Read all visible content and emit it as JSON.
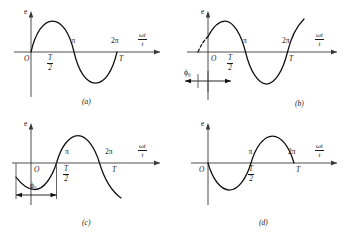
{
  "figure": {
    "type": "diagram",
    "background_color": "#ffffff",
    "curve_color": "#111111",
    "axis_color": "#3a3a3a",
    "panel_count": 4
  },
  "axis_labels": {
    "vertical": "e",
    "horizontal_numerator": "ωt",
    "horizontal_denominator": "t",
    "origin": "O",
    "pi": "π",
    "two_pi": "2π",
    "half_period_numerator": "T",
    "half_period_denominator": "2",
    "period": "T",
    "phase": "ϕ",
    "phase_subscript": "0"
  },
  "panels": [
    {
      "id": "a",
      "caption": "(a)",
      "phase_label": null,
      "description": "Sine wave starting at zero with zero initial phase",
      "waveform": {
        "form": "sine",
        "amplitude": 1,
        "phase_deg": 0,
        "start_value": 0,
        "first_half_sign": "positive",
        "dashed_lead_in": false,
        "dimension_arrow": false
      },
      "tick_labels_above": [
        "π",
        "2π"
      ],
      "tick_labels_below": [
        "O",
        "T/2",
        "T"
      ]
    },
    {
      "id": "b",
      "caption": "(b)",
      "phase_label": "ϕ₀",
      "description": "Sine wave leading by initial phase angle phi-zero, positive at t = 0",
      "waveform": {
        "form": "sine",
        "amplitude": 1,
        "phase_deg": 30,
        "start_value": 0.5,
        "first_half_sign": "positive",
        "dashed_lead_in": true,
        "dimension_arrow": true,
        "dimension_direction": "leading"
      },
      "tick_labels_above": [
        "π",
        "2π"
      ],
      "tick_labels_below": [
        "O",
        "T/2",
        "T"
      ]
    },
    {
      "id": "c",
      "caption": "(c)",
      "phase_label": "ϕ₀",
      "description": "Sine wave lagging by initial phase angle phi-zero, negative at t = 0",
      "waveform": {
        "form": "sine",
        "amplitude": 1,
        "phase_deg": -60,
        "start_value": -0.87,
        "first_half_sign": "negative",
        "dashed_lead_in": false,
        "dimension_arrow": true,
        "dimension_direction": "lagging"
      },
      "tick_labels_above": [
        "π",
        "2π"
      ],
      "tick_labels_below": [
        "O",
        "T/2",
        "T"
      ]
    },
    {
      "id": "d",
      "caption": "(d)",
      "phase_label": null,
      "description": "Inverted sine wave, initial phase of 180 degrees, starting at zero going negative",
      "waveform": {
        "form": "sine",
        "amplitude": 1,
        "phase_deg": 180,
        "start_value": 0,
        "first_half_sign": "negative",
        "dashed_lead_in": false,
        "dimension_arrow": false
      },
      "tick_labels_above": [
        "π",
        "2π"
      ],
      "tick_labels_below": [
        "O",
        "T/2",
        "T"
      ]
    }
  ]
}
